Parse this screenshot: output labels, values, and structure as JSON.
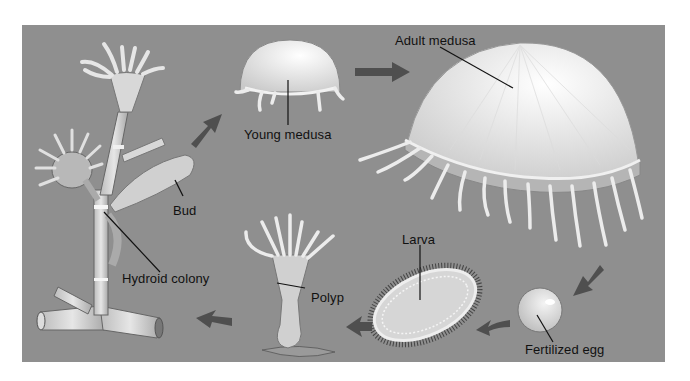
{
  "diagram": {
    "type": "life-cycle",
    "colors": {
      "background": "#8f8f8f",
      "arrow": "#4f4f4f",
      "organism": "#e8e8e8",
      "label_text": "#111111"
    },
    "stages": [
      {
        "id": "hydroid-colony",
        "label": "Hydroid colony"
      },
      {
        "id": "bud",
        "label": "Bud"
      },
      {
        "id": "young-medusa",
        "label": "Young medusa"
      },
      {
        "id": "adult-medusa",
        "label": "Adult medusa"
      },
      {
        "id": "fertilized-egg",
        "label": "Fertilized egg"
      },
      {
        "id": "larva",
        "label": "Larva"
      },
      {
        "id": "polyp",
        "label": "Polyp"
      }
    ],
    "flow": [
      "Bud → Young medusa",
      "Young medusa → Adult medusa",
      "Adult medusa → Fertilized egg",
      "Fertilized egg → Larva",
      "Larva → Polyp",
      "Polyp → Hydroid colony"
    ]
  }
}
